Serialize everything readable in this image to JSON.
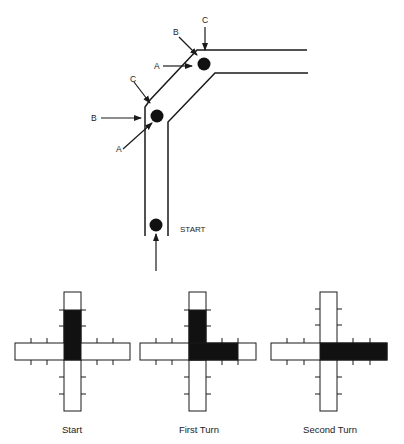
{
  "top_diagram": {
    "labels": {
      "a_upper": "A",
      "b_upper": "B",
      "c_upper": "C",
      "a_lower": "A",
      "b_lower": "B",
      "c_lower": "C",
      "start": "START"
    }
  },
  "bottom_panels": [
    {
      "caption": "Start"
    },
    {
      "caption": "First Turn"
    },
    {
      "caption": "Second Turn"
    }
  ],
  "colors": {
    "ink": "#1a1a1a",
    "fill": "#111111",
    "background": "#ffffff"
  }
}
